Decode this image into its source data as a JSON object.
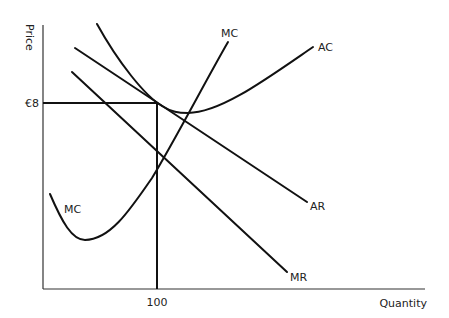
{
  "diagram": {
    "title": "",
    "type": "economics-cost-revenue-diagram",
    "axes": {
      "y_label": "Price",
      "x_label": "Quantity"
    },
    "reference": {
      "price_label": "€8",
      "quantity_label": "100"
    },
    "curves": {
      "mc_top_label": "MC",
      "mc_bottom_label": "MC",
      "ac_label": "AC",
      "ar_label": "AR",
      "mr_label": "MR"
    }
  }
}
